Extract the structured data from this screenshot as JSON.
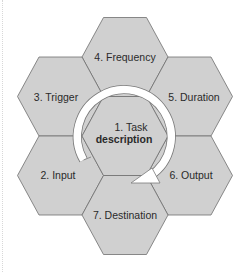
{
  "diagram": {
    "type": "hexagon-cycle",
    "colors": {
      "hex_fill": "#d0d0d0",
      "hex_stroke": "#6e6e6e",
      "arrow_fill": "#ffffff",
      "arrow_stroke": "#7a7a7a",
      "text": "#2a2a2a"
    },
    "center": {
      "line1": "1. Task",
      "line2": "description"
    },
    "hexes": [
      {
        "id": "input",
        "label": "2. Input"
      },
      {
        "id": "trigger",
        "label": "3. Trigger"
      },
      {
        "id": "frequency",
        "label": "4. Frequency"
      },
      {
        "id": "duration",
        "label": "5. Duration"
      },
      {
        "id": "output",
        "label": "6. Output"
      },
      {
        "id": "destination",
        "label": "7. Destination"
      }
    ],
    "arrow": {
      "direction": "clockwise",
      "from": "2. Input",
      "to": "6. Output"
    }
  }
}
